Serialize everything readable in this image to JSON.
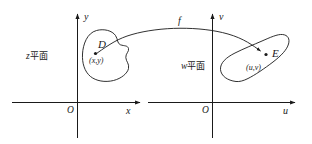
{
  "figure": {
    "stroke_color": "#1a1a1a",
    "background_color": "#ffffff"
  },
  "left_plane": {
    "label_prefix": "z",
    "label_suffix": "平面",
    "x_axis_label": "x",
    "y_axis_label": "y",
    "origin_label": "O",
    "region_label": "D",
    "point_label": "(x,y)"
  },
  "right_plane": {
    "label_prefix": "w",
    "label_suffix": "平面",
    "x_axis_label": "u",
    "y_axis_label": "v",
    "origin_label": "O",
    "region_label": "E",
    "point_label": "(u,v)"
  },
  "mapping": {
    "label": "f"
  }
}
